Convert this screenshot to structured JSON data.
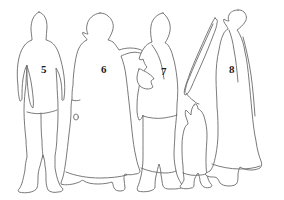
{
  "plate": {
    "title": "Numbered figure outline plate",
    "background_color": "#ffffff",
    "line_color": "#6b6b6b",
    "label_color": "#1a1a1a",
    "width": 284,
    "height": 200
  },
  "figures": [
    {
      "number": "5",
      "name": "standing-figure-trousers",
      "label_x": 41,
      "label_y": 64,
      "description": "standing figure wearing head covering, tunic and trousers, arm at side"
    },
    {
      "number": "6",
      "name": "standing-figure-long-robe",
      "label_x": 101,
      "label_y": 64,
      "description": "standing figure in long flaring robe with extended arm"
    },
    {
      "number": "7",
      "name": "standing-figure-with-staff",
      "label_x": 161,
      "label_y": 66,
      "description": "standing figure in long garment holding a staff, small pennant shape at side"
    },
    {
      "number": "8",
      "name": "standing-figure-cloak",
      "label_x": 229,
      "label_y": 64,
      "description": "standing figure enveloped in a wide cloak"
    }
  ],
  "extra_elements": [
    {
      "name": "child-figure",
      "description": "small child figure standing between figure 7 and figure 8"
    },
    {
      "name": "staff-object",
      "description": "long diagonal staff or spear leaning behind figure 7"
    },
    {
      "name": "pennant-shape",
      "description": "small angular pennant or cloth shape beside figure 7"
    },
    {
      "name": "robe-button",
      "description": "small circular detail on the robe of figure 6"
    }
  ]
}
